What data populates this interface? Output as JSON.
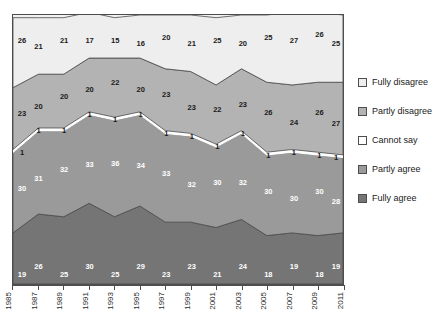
{
  "chart_data": {
    "type": "area",
    "stacked": true,
    "title": "",
    "xlabel": "",
    "ylabel": "",
    "ylim": [
      0,
      100
    ],
    "grid": false,
    "legend_position": "right",
    "categories": [
      "1985",
      "1986",
      "1987",
      "1988",
      "1989",
      "1990",
      "1991",
      "1992",
      "1993",
      "1994",
      "1995",
      "1996",
      "1997",
      "1998"
    ],
    "x_tick_labels": [
      "1985",
      "1987",
      "1989",
      "1991",
      "1993",
      "1995",
      "1997",
      "1999",
      "2001",
      "2003",
      "2005",
      "2007",
      "2009",
      "2011"
    ],
    "series": [
      {
        "name": "Fully disagree",
        "color": "#eeeeee",
        "values": [
          26,
          21,
          21,
          17,
          15,
          16,
          20,
          21,
          25,
          20,
          25,
          27,
          26,
          25
        ]
      },
      {
        "name": "Partly disagree",
        "color": "#b3b3b3",
        "values": [
          23,
          20,
          20,
          20,
          22,
          20,
          23,
          23,
          22,
          23,
          26,
          24,
          26,
          27
        ]
      },
      {
        "name": "Cannot say",
        "color": "#ffffff",
        "values": [
          1,
          1,
          1,
          1,
          1,
          1,
          1,
          1,
          1,
          1,
          1,
          1,
          1,
          1
        ]
      },
      {
        "name": "Partly agree",
        "color": "#9a9a9a",
        "values": [
          30,
          31,
          32,
          33,
          36,
          34,
          33,
          32,
          30,
          32,
          30,
          30,
          30,
          28
        ]
      },
      {
        "name": "Fully agree",
        "color": "#757575",
        "values": [
          19,
          26,
          25,
          30,
          25,
          29,
          23,
          23,
          21,
          24,
          18,
          19,
          18,
          19
        ]
      }
    ]
  },
  "legend": {
    "items": [
      {
        "label": "Fully disagree"
      },
      {
        "label": "Partly disagree"
      },
      {
        "label": "Cannot say"
      },
      {
        "label": "Partly agree"
      },
      {
        "label": "Fully agree"
      }
    ]
  }
}
